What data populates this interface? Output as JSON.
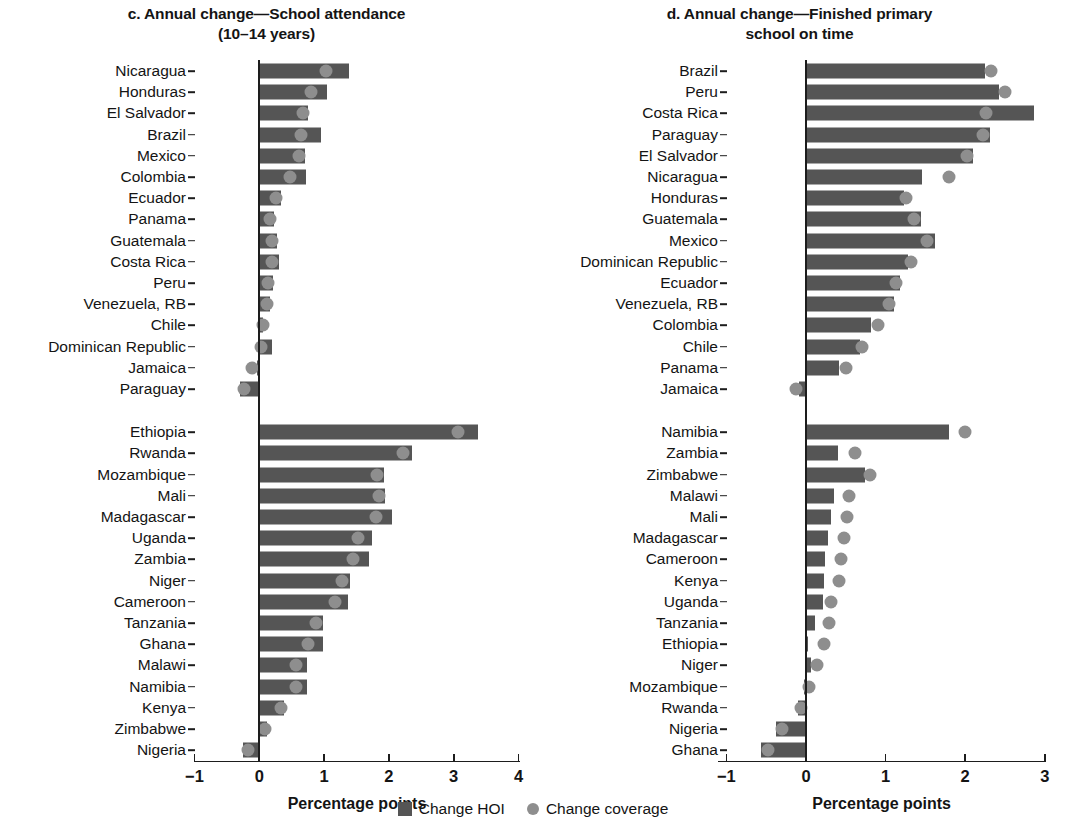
{
  "legend": {
    "hoi_label": "Change HOI",
    "coverage_label": "Change coverage"
  },
  "panels": {
    "c": {
      "title_line1": "c. Annual change—School attendance",
      "title_line2": "(10–14 years)",
      "axis_title": "Percentage points",
      "ticks": [
        "−1",
        "0",
        "1",
        "2",
        "3",
        "4"
      ]
    },
    "d": {
      "title_line1": "d. Annual change—Finished primary",
      "title_line2": "school on time",
      "axis_title": "Percentage points",
      "ticks": [
        "−1",
        "0",
        "1",
        "2",
        "3"
      ]
    }
  },
  "chart_data": [
    {
      "id": "c",
      "type": "bar",
      "orientation": "horizontal",
      "title": "c. Annual change—School attendance (10–14 years)",
      "xlabel": "Percentage points",
      "ylabel": "",
      "xlim": [
        -1,
        4
      ],
      "xticks": [
        -1,
        0,
        1,
        2,
        3,
        4
      ],
      "grid": false,
      "legend_position": "bottom-center",
      "groups": [
        {
          "name": "Latin America and the Caribbean",
          "categories": [
            "Nicaragua",
            "Honduras",
            "El Salvador",
            "Brazil",
            "Mexico",
            "Colombia",
            "Ecuador",
            "Panama",
            "Guatemala",
            "Costa Rica",
            "Peru",
            "Venezuela, RB",
            "Chile",
            "Dominican Republic",
            "Jamaica",
            "Paraguay"
          ],
          "series": [
            {
              "name": "Change HOI",
              "values": [
                1.38,
                1.05,
                0.75,
                0.95,
                0.7,
                0.72,
                0.34,
                0.22,
                0.28,
                0.3,
                0.21,
                0.17,
                0.06,
                0.2,
                -0.04,
                -0.3
              ]
            },
            {
              "name": "Change coverage",
              "values": [
                1.03,
                0.8,
                0.68,
                0.64,
                0.62,
                0.48,
                0.26,
                0.17,
                0.19,
                0.2,
                0.14,
                0.12,
                0.05,
                0.02,
                -0.12,
                -0.24
              ]
            }
          ]
        },
        {
          "name": "Sub-Saharan Africa",
          "categories": [
            "Ethiopia",
            "Rwanda",
            "Mozambique",
            "Mali",
            "Madagascar",
            "Uganda",
            "Zambia",
            "Niger",
            "Cameroon",
            "Tanzania",
            "Ghana",
            "Malawi",
            "Namibia",
            "Kenya",
            "Zimbabwe",
            "Nigeria"
          ],
          "series": [
            {
              "name": "Change HOI",
              "values": [
                3.38,
                2.35,
                1.92,
                1.94,
                2.05,
                1.74,
                1.69,
                1.4,
                1.37,
                0.99,
                0.98,
                0.74,
                0.73,
                0.38,
                0.12,
                -0.25
              ]
            },
            {
              "name": "Change coverage",
              "values": [
                3.06,
                2.22,
                1.82,
                1.84,
                1.8,
                1.52,
                1.45,
                1.28,
                1.17,
                0.88,
                0.75,
                0.57,
                0.57,
                0.33,
                0.09,
                -0.18
              ]
            }
          ]
        }
      ]
    },
    {
      "id": "d",
      "type": "bar",
      "orientation": "horizontal",
      "title": "d. Annual change—Finished primary school on time",
      "xlabel": "Percentage points",
      "ylabel": "",
      "xlim": [
        -1,
        3
      ],
      "xticks": [
        -1,
        0,
        1,
        2,
        3
      ],
      "grid": false,
      "legend_position": "bottom-center",
      "groups": [
        {
          "name": "Latin America and the Caribbean",
          "categories": [
            "Brazil",
            "Peru",
            "Costa Rica",
            "Paraguay",
            "El Salvador",
            "Nicaragua",
            "Honduras",
            "Guatemala",
            "Mexico",
            "Dominican Republic",
            "Ecuador",
            "Venezuela, RB",
            "Colombia",
            "Chile",
            "Panama",
            "Jamaica"
          ],
          "series": [
            {
              "name": "Change HOI",
              "values": [
                2.25,
                2.42,
                2.86,
                2.31,
                2.1,
                1.46,
                1.23,
                1.44,
                1.62,
                1.28,
                1.18,
                1.1,
                0.82,
                0.68,
                0.41,
                -0.09
              ]
            },
            {
              "name": "Change coverage",
              "values": [
                2.33,
                2.5,
                2.26,
                2.22,
                2.02,
                1.8,
                1.26,
                1.36,
                1.52,
                1.32,
                1.13,
                1.04,
                0.9,
                0.7,
                0.5,
                -0.13
              ]
            }
          ]
        },
        {
          "name": "Sub-Saharan Africa",
          "categories": [
            "Namibia",
            "Zambia",
            "Zimbabwe",
            "Malawi",
            "Mali",
            "Madagascar",
            "Cameroon",
            "Kenya",
            "Uganda",
            "Tanzania",
            "Ethiopia",
            "Niger",
            "Mozambique",
            "Rwanda",
            "Nigeria",
            "Ghana"
          ],
          "series": [
            {
              "name": "Change HOI",
              "values": [
                1.8,
                0.4,
                0.74,
                0.35,
                0.32,
                0.28,
                0.24,
                0.22,
                0.21,
                0.11,
                0.02,
                0.06,
                -0.03,
                -0.1,
                -0.38,
                -0.56
              ]
            },
            {
              "name": "Change coverage",
              "values": [
                2.0,
                0.62,
                0.8,
                0.54,
                0.52,
                0.48,
                0.44,
                0.41,
                0.31,
                0.29,
                0.22,
                0.14,
                0.04,
                -0.06,
                -0.3,
                -0.48
              ]
            }
          ]
        }
      ]
    }
  ]
}
